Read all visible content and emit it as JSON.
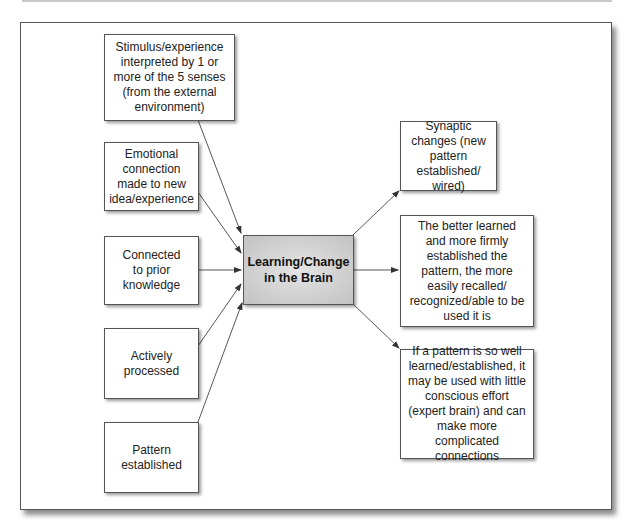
{
  "diagram": {
    "center": {
      "label": "Learning/Change in the Brain"
    },
    "inputs": [
      {
        "label": "Stimulus/experience interpreted by 1 or more of the 5 senses (from the external environment)"
      },
      {
        "label": "Emotional connection made to new idea/experience"
      },
      {
        "label": "Connected to prior knowledge"
      },
      {
        "label": "Actively processed"
      },
      {
        "label": "Pattern established"
      }
    ],
    "outputs": [
      {
        "label": "Synaptic changes (new pattern established/ wired)"
      },
      {
        "label": "The better learned and more firmly established the pattern, the more easily recalled/ recognized/able to be used it is"
      },
      {
        "label": "If a pattern is so well learned/established, it may be used with little conscious effort (expert brain) and can make more complicated connections"
      }
    ],
    "colors": {
      "border": "#555555",
      "center_fill": "#c8c8c8",
      "arrow": "#333333"
    }
  }
}
